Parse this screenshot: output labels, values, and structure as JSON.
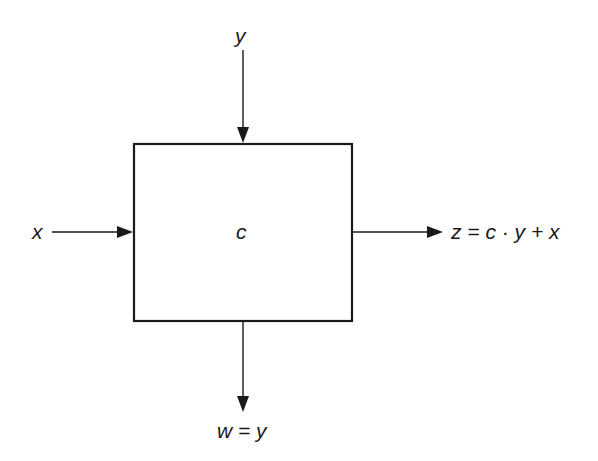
{
  "diagram": {
    "type": "block-diagram",
    "block": {
      "label": "c",
      "x": 133,
      "y": 143,
      "width": 220,
      "height": 179
    },
    "inputs": [
      {
        "id": "y",
        "label": "y",
        "direction": "top"
      },
      {
        "id": "x",
        "label": "x",
        "direction": "left"
      }
    ],
    "outputs": [
      {
        "id": "z",
        "label": "z = c · y + x",
        "direction": "right"
      },
      {
        "id": "w",
        "label": "w = y",
        "direction": "bottom"
      }
    ],
    "colors": {
      "stroke": "#1a1a1a",
      "background": "#ffffff"
    }
  }
}
